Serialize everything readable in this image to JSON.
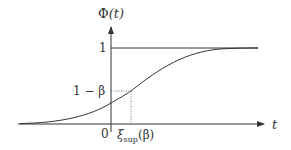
{
  "diagram": {
    "y_axis_label": "Φ(t)",
    "x_axis_label": "t",
    "y_ticks": [
      {
        "label": "1",
        "value": 1
      },
      {
        "label": "1 − β",
        "value": "1-beta"
      }
    ],
    "x_ticks": [
      {
        "label": "0",
        "value": 0
      },
      {
        "label": "ξsup(β)",
        "value": "xi_sup(beta)"
      }
    ],
    "labels": {
      "phi": "Φ",
      "phi_arg": "(t)",
      "t": "t",
      "one": "1",
      "one_minus_beta": "1 − β",
      "zero": "0",
      "xi": "ξ",
      "xi_sub": "sup",
      "xi_arg": "(β)"
    },
    "elements": [
      "x-axis with arrow",
      "y-axis with arrow",
      "horizontal asymptote line at 1",
      "sigmoid CDF curve",
      "dotted guide from 1−β to curve",
      "dotted guide from curve down to ξsup(β)"
    ],
    "colors": {
      "stroke": "#333333",
      "dotted": "#555555"
    }
  }
}
